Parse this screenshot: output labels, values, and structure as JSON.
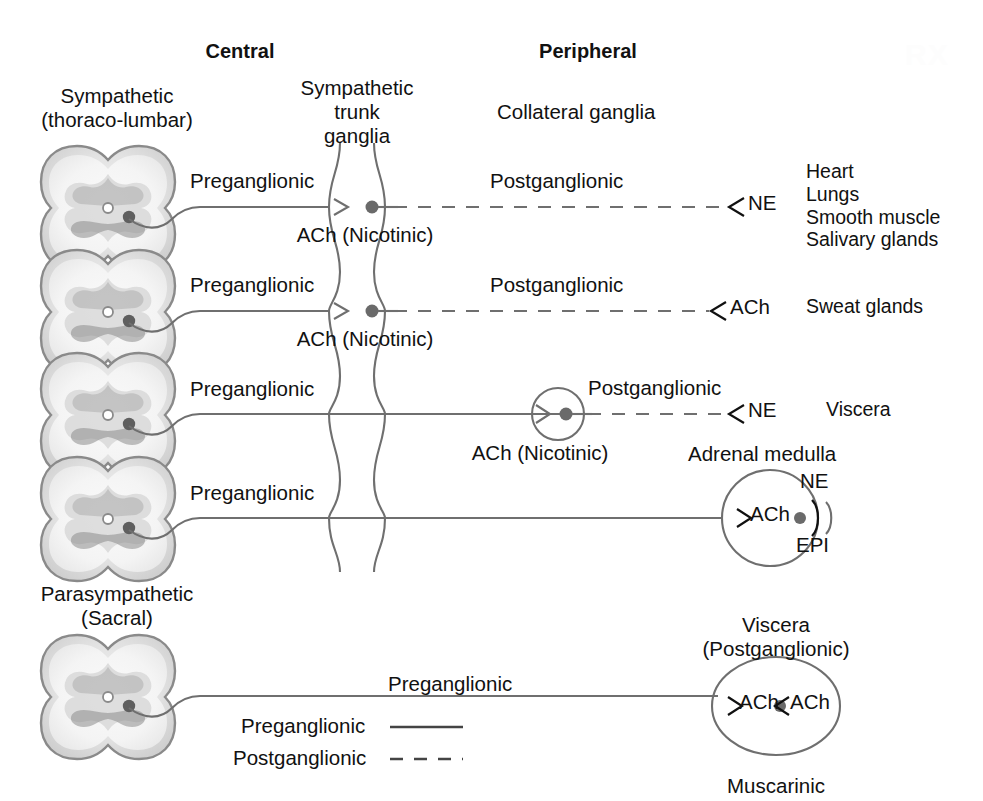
{
  "figure": {
    "title_central": "Central",
    "title_peripheral": "Peripheral",
    "watermark": "RX"
  },
  "colors": {
    "text": "#111111",
    "line": "#6f6f6f",
    "synapse_dot": "#6a6a6a",
    "cord_outline": "#777777",
    "cord_gray": "#b9b9b9"
  },
  "labels": {
    "sympathetic_division": "Sympathetic",
    "sympathetic_division_sub": "(thoraco-lumbar)",
    "trunk_ganglia_1": "Sympathetic",
    "trunk_ganglia_2": "trunk",
    "trunk_ganglia_3": "ganglia",
    "collateral_ganglia": "Collateral ganglia",
    "parasympathetic_division": "Parasympathetic",
    "parasympathetic_division_sub": "(Sacral)",
    "adrenal_medulla": "Adrenal medulla",
    "viscera_post_1": "Viscera",
    "viscera_post_2": "(Postganglionic)",
    "muscarinic": "Muscarinic"
  },
  "rows": [
    {
      "id": "row-1-heart-lungs",
      "pre_label": "Preganglionic",
      "ganglion_transmitter": "ACh (Nicotinic)",
      "post_label": "Postganglionic",
      "terminal_transmitter": "NE",
      "targets": [
        "Heart",
        "Lungs",
        "Smooth muscle",
        "Salivary glands"
      ]
    },
    {
      "id": "row-2-sweat-glands",
      "pre_label": "Preganglionic",
      "ganglion_transmitter": "ACh (Nicotinic)",
      "post_label": "Postganglionic",
      "terminal_transmitter": "ACh",
      "targets": [
        "Sweat glands"
      ]
    },
    {
      "id": "row-3-viscera",
      "pre_label": "Preganglionic",
      "ganglion_transmitter": "ACh (Nicotinic)",
      "post_label": "Postganglionic",
      "terminal_transmitter": "NE",
      "targets": [
        "Viscera"
      ]
    },
    {
      "id": "row-4-adrenal-medulla",
      "pre_label": "Preganglionic",
      "ganglion_transmitter": "ACh",
      "hormone_top": "NE",
      "hormone_bottom": "EPI",
      "targets": []
    },
    {
      "id": "row-5-parasympathetic",
      "pre_label": "Preganglionic",
      "ganglion_transmitter_in": "ACh",
      "ganglion_transmitter_out": "ACh",
      "receptor": "Muscarinic",
      "targets": []
    }
  ],
  "legend": {
    "preganglionic_label": "Preganglionic",
    "postganglionic_label": "Postganglionic",
    "preganglionic_style": "solid",
    "postganglionic_style": "dashed"
  }
}
